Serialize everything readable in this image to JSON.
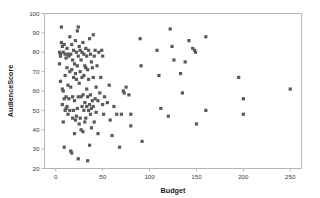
{
  "chart_data": {
    "type": "scatter",
    "title": "",
    "xlabel": "Budget",
    "ylabel": "AudienceScore",
    "xlim": [
      -12,
      262
    ],
    "ylim": [
      20,
      100
    ],
    "xticks": [
      0,
      50,
      100,
      150,
      200,
      250
    ],
    "yticks": [
      20,
      30,
      40,
      50,
      60,
      70,
      80,
      90,
      100
    ],
    "grid": false,
    "legend": null,
    "marker_color": "#5a5a5a",
    "marker_size": 1.6,
    "frame_color": "#b6b6b6",
    "series": [
      {
        "name": "Movies",
        "points": [
          [
            4,
            74
          ],
          [
            4,
            80
          ],
          [
            5,
            79
          ],
          [
            5,
            78
          ],
          [
            5,
            65
          ],
          [
            6,
            93
          ],
          [
            6,
            85
          ],
          [
            7,
            83
          ],
          [
            7,
            61
          ],
          [
            7,
            53
          ],
          [
            8,
            80
          ],
          [
            8,
            60
          ],
          [
            8,
            44
          ],
          [
            9,
            84
          ],
          [
            9,
            56
          ],
          [
            9,
            31
          ],
          [
            10,
            79
          ],
          [
            10,
            68
          ],
          [
            10,
            50
          ],
          [
            11,
            77
          ],
          [
            11,
            57
          ],
          [
            11,
            51
          ],
          [
            12,
            82
          ],
          [
            12,
            72
          ],
          [
            12,
            52
          ],
          [
            13,
            79
          ],
          [
            13,
            63
          ],
          [
            13,
            48
          ],
          [
            14,
            78
          ],
          [
            14,
            56
          ],
          [
            15,
            88
          ],
          [
            15,
            70
          ],
          [
            15,
            50
          ],
          [
            16,
            79
          ],
          [
            16,
            62
          ],
          [
            16,
            29
          ],
          [
            17,
            84
          ],
          [
            17,
            71
          ],
          [
            17,
            28
          ],
          [
            18,
            76
          ],
          [
            18,
            57
          ],
          [
            18,
            46
          ],
          [
            19,
            81
          ],
          [
            19,
            67
          ],
          [
            19,
            50
          ],
          [
            20,
            74
          ],
          [
            20,
            55
          ],
          [
            20,
            38
          ],
          [
            21,
            86
          ],
          [
            21,
            69
          ],
          [
            21,
            45
          ],
          [
            22,
            80
          ],
          [
            22,
            66
          ],
          [
            22,
            47
          ],
          [
            23,
            91
          ],
          [
            23,
            73
          ],
          [
            23,
            51
          ],
          [
            24,
            93
          ],
          [
            24,
            78
          ],
          [
            24,
            57
          ],
          [
            24,
            25
          ],
          [
            25,
            83
          ],
          [
            25,
            64
          ],
          [
            25,
            43
          ],
          [
            26,
            81
          ],
          [
            26,
            70
          ],
          [
            26,
            46
          ],
          [
            27,
            76
          ],
          [
            27,
            57
          ],
          [
            27,
            40
          ],
          [
            28,
            80
          ],
          [
            28,
            67
          ],
          [
            28,
            52
          ],
          [
            29,
            85
          ],
          [
            29,
            58
          ],
          [
            29,
            39
          ],
          [
            30,
            79
          ],
          [
            30,
            68
          ],
          [
            30,
            50
          ],
          [
            31,
            73
          ],
          [
            31,
            54
          ],
          [
            31,
            44
          ],
          [
            32,
            82
          ],
          [
            32,
            72
          ],
          [
            32,
            46
          ],
          [
            33,
            78
          ],
          [
            33,
            61
          ],
          [
            33,
            52
          ],
          [
            34,
            71
          ],
          [
            34,
            57
          ],
          [
            34,
            24
          ],
          [
            35,
            81
          ],
          [
            35,
            66
          ],
          [
            35,
            50
          ],
          [
            36,
            87
          ],
          [
            36,
            53
          ],
          [
            36,
            32
          ],
          [
            37,
            79
          ],
          [
            37,
            58
          ],
          [
            37,
            48
          ],
          [
            38,
            75
          ],
          [
            38,
            51
          ],
          [
            38,
            41
          ],
          [
            39,
            72
          ],
          [
            39,
            55
          ],
          [
            40,
            89
          ],
          [
            40,
            67
          ],
          [
            40,
            52
          ],
          [
            41,
            78
          ],
          [
            41,
            44
          ],
          [
            42,
            81
          ],
          [
            42,
            56
          ],
          [
            43,
            62
          ],
          [
            43,
            49
          ],
          [
            44,
            73
          ],
          [
            45,
            55
          ],
          [
            45,
            38
          ],
          [
            46,
            80
          ],
          [
            47,
            59
          ],
          [
            48,
            67
          ],
          [
            49,
            81
          ],
          [
            50,
            78
          ],
          [
            50,
            53
          ],
          [
            51,
            48
          ],
          [
            52,
            57
          ],
          [
            55,
            54
          ],
          [
            57,
            63
          ],
          [
            58,
            45
          ],
          [
            60,
            37
          ],
          [
            62,
            52
          ],
          [
            65,
            48
          ],
          [
            68,
            31
          ],
          [
            70,
            48
          ],
          [
            72,
            60
          ],
          [
            73,
            59
          ],
          [
            75,
            62
          ],
          [
            78,
            58
          ],
          [
            80,
            48
          ],
          [
            80,
            42
          ],
          [
            90,
            87
          ],
          [
            91,
            73
          ],
          [
            92,
            34
          ],
          [
            108,
            81
          ],
          [
            110,
            68
          ],
          [
            112,
            51
          ],
          [
            120,
            47
          ],
          [
            122,
            92
          ],
          [
            124,
            83
          ],
          [
            126,
            76
          ],
          [
            133,
            69
          ],
          [
            135,
            59
          ],
          [
            138,
            75
          ],
          [
            142,
            86
          ],
          [
            146,
            82
          ],
          [
            148,
            81
          ],
          [
            149,
            80
          ],
          [
            150,
            43
          ],
          [
            160,
            88
          ],
          [
            160,
            50
          ],
          [
            195,
            67
          ],
          [
            200,
            56
          ],
          [
            200,
            48
          ],
          [
            250,
            61
          ]
        ]
      }
    ]
  }
}
